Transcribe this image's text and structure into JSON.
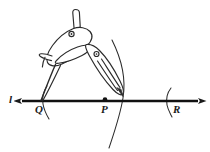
{
  "figure": {
    "background_color": "#ffffff",
    "ink_color": "#1a1a1a",
    "line": {
      "name": "line-l",
      "label": "l",
      "y": 101,
      "x_start": 20,
      "x_end": 200,
      "arrow_left": true,
      "arrow_right": true,
      "stroke_width": 2.2
    },
    "points": [
      {
        "id": "Q",
        "label": "Q",
        "x": 40,
        "y": 101,
        "marked_dot": false,
        "role": "compass-needle-point"
      },
      {
        "id": "P",
        "label": "P",
        "x": 105,
        "y": 100,
        "marked_dot": true,
        "role": "given-point"
      },
      {
        "id": "R",
        "label": "R",
        "x": 168,
        "y": 101,
        "marked_dot": false,
        "role": "arc-intersection"
      }
    ],
    "arcs": [
      {
        "id": "arc-main",
        "center": "Q",
        "through": "right-of-P",
        "x_at_line": 123,
        "description": "large arc swept by the pencil leg from above the line down past the line"
      },
      {
        "id": "arc-left",
        "center": "P",
        "x_at_line": 44,
        "description": "short arc tick crossing the line just right of Q"
      },
      {
        "id": "arc-right",
        "center": "P",
        "x_at_line": 168,
        "description": "short arc tick crossing the line at R"
      }
    ],
    "compass": {
      "name": "compass-tool",
      "hinge_x": 88,
      "hinge_y": 48,
      "top_knob": {
        "x": 74,
        "y": 10,
        "width": 9,
        "height": 18
      },
      "needle_leg": {
        "from_x": 80,
        "from_y": 40,
        "to_x": 40,
        "to_y": 101
      },
      "pencil_leg": {
        "from_x": 95,
        "from_y": 50,
        "to_x": 123,
        "to_y": 95
      },
      "has_thumb_lever": true,
      "has_hinge_screw": true,
      "has_pencil_clamp_screw": true
    }
  }
}
